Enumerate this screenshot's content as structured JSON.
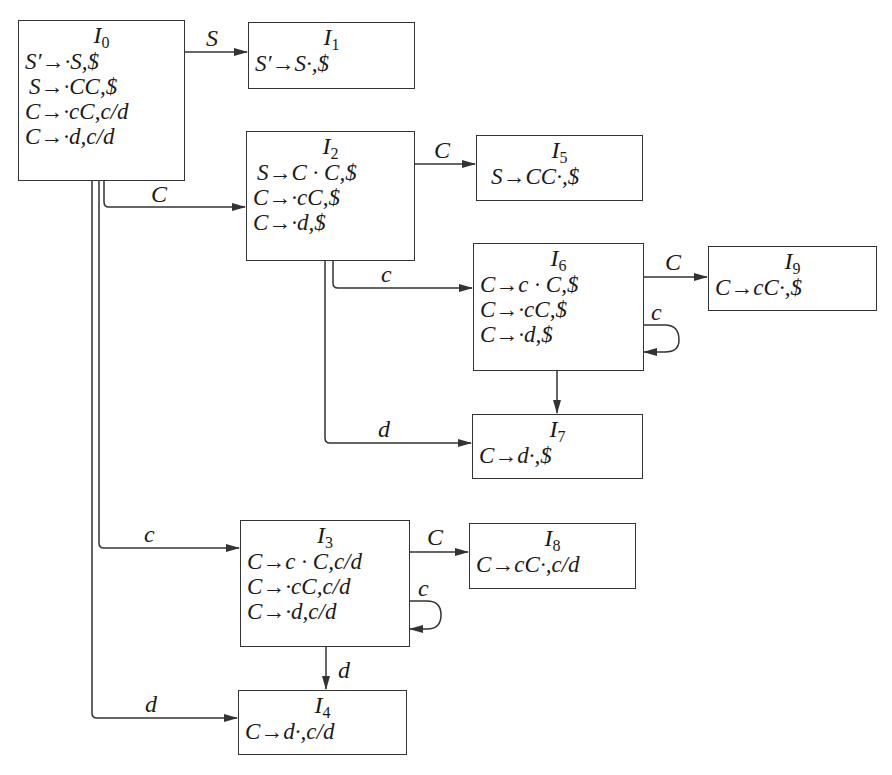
{
  "diagram": {
    "type": "LR(1) item-set automaton",
    "states": [
      {
        "id": "I0",
        "name": "I",
        "sub": "0",
        "items": [
          "S′→·S,$",
          " S→·CC,$",
          "C→·cC,c/d",
          "C→·d,c/d"
        ]
      },
      {
        "id": "I1",
        "name": "I",
        "sub": "1",
        "items": [
          "S′→S·,$"
        ]
      },
      {
        "id": "I2",
        "name": "I",
        "sub": "2",
        "items": [
          " S→C · C,$",
          "C→·cC,$",
          "C→·d,$"
        ]
      },
      {
        "id": "I3",
        "name": "I",
        "sub": "3",
        "items": [
          "C→c · C,c/d",
          "C→·cC,c/d",
          "C→·d,c/d"
        ]
      },
      {
        "id": "I4",
        "name": "I",
        "sub": "4",
        "items": [
          "C→d·,c/d"
        ]
      },
      {
        "id": "I5",
        "name": "I",
        "sub": "5",
        "items": [
          "S→CC·,$"
        ]
      },
      {
        "id": "I6",
        "name": "I",
        "sub": "6",
        "items": [
          "C→c · C,$",
          "C→·cC,$",
          "C→·d,$"
        ]
      },
      {
        "id": "I7",
        "name": "I",
        "sub": "7",
        "items": [
          "C→d·,$"
        ]
      },
      {
        "id": "I8",
        "name": "I",
        "sub": "8",
        "items": [
          "C→cC·,c/d"
        ]
      },
      {
        "id": "I9",
        "name": "I",
        "sub": "9",
        "items": [
          "C→cC·,$"
        ]
      }
    ],
    "transitions": [
      {
        "from": "I0",
        "to": "I1",
        "symbol": "S"
      },
      {
        "from": "I0",
        "to": "I2",
        "symbol": "C"
      },
      {
        "from": "I0",
        "to": "I3",
        "symbol": "c"
      },
      {
        "from": "I0",
        "to": "I4",
        "symbol": "d"
      },
      {
        "from": "I2",
        "to": "I5",
        "symbol": "C"
      },
      {
        "from": "I2",
        "to": "I6",
        "symbol": "c"
      },
      {
        "from": "I2",
        "to": "I7",
        "symbol": "d"
      },
      {
        "from": "I6",
        "to": "I9",
        "symbol": "C"
      },
      {
        "from": "I6",
        "to": "I6",
        "symbol": "c"
      },
      {
        "from": "I6",
        "to": "I7",
        "symbol": "d"
      },
      {
        "from": "I3",
        "to": "I8",
        "symbol": "C"
      },
      {
        "from": "I3",
        "to": "I3",
        "symbol": "c"
      },
      {
        "from": "I3",
        "to": "I4",
        "symbol": "d"
      }
    ]
  },
  "edge_labels": {
    "i0_i1": "S",
    "i0_i2": "C",
    "i0_i3": "c",
    "i0_i4": "d",
    "i2_i5": "C",
    "i2_i6": "c",
    "i2_i7": "d",
    "i6_i9": "C",
    "i6_loop": "c",
    "i3_i8": "C",
    "i3_loop": "c",
    "i3_i4": "d"
  },
  "colors": {
    "line": "#333333",
    "text": "#1a1a1a",
    "background": "#ffffff"
  }
}
